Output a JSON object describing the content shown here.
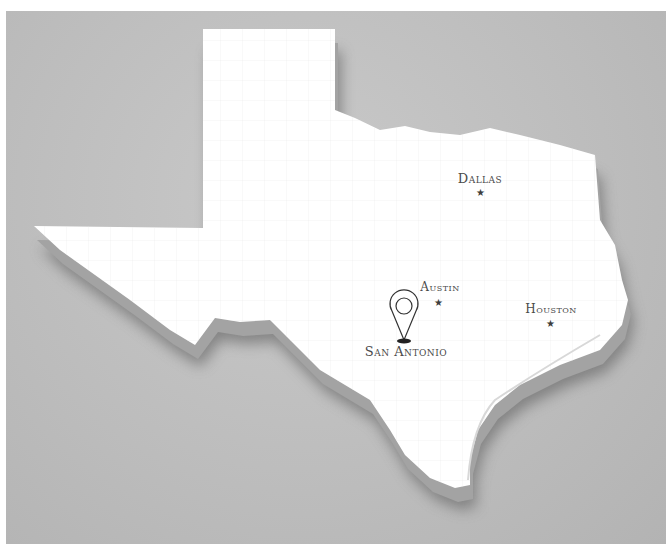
{
  "map": {
    "region": "Texas",
    "style": "3D extruded white state map with county boundaries on gray background",
    "colors": {
      "background": "#bdbdbd",
      "land": "#ffffff",
      "extrusion": "#9a9a9a",
      "shadow": "#7a7a7a",
      "label": "#4a4a4a",
      "marker": "#3d3d3d"
    },
    "cities": [
      {
        "name": "Dallas",
        "marker": "star-icon",
        "label_x": 480,
        "label_y": 183,
        "x": 480,
        "y": 192
      },
      {
        "name": "Austin",
        "marker": "star-icon",
        "label_x": 440,
        "label_y": 290,
        "x": 438,
        "y": 302
      },
      {
        "name": "Houston",
        "marker": "star-icon",
        "label_x": 551,
        "label_y": 312,
        "x": 550,
        "y": 323
      },
      {
        "name": "San Antonio",
        "marker": "location-pin-icon",
        "label_x": 406,
        "label_y": 355,
        "x": 404,
        "y": 340
      }
    ]
  }
}
